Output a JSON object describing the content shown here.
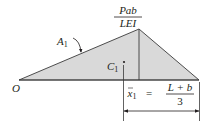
{
  "diagram": {
    "type": "moment-area-diagram",
    "colors": {
      "fill": "#d9d9d9",
      "stroke": "#3a3a3a",
      "text": "#231f20"
    },
    "peak_label": {
      "numerator": "Pab",
      "denominator": "LEI"
    },
    "area_label": {
      "main": "A",
      "sub": "1"
    },
    "centroid_label": {
      "main": "C",
      "sub": "1"
    },
    "origin_label": "O",
    "dimension": {
      "lhs_main": "x",
      "lhs_sub": "1",
      "equals": "=",
      "numerator": "L + b",
      "denominator": "3"
    }
  }
}
